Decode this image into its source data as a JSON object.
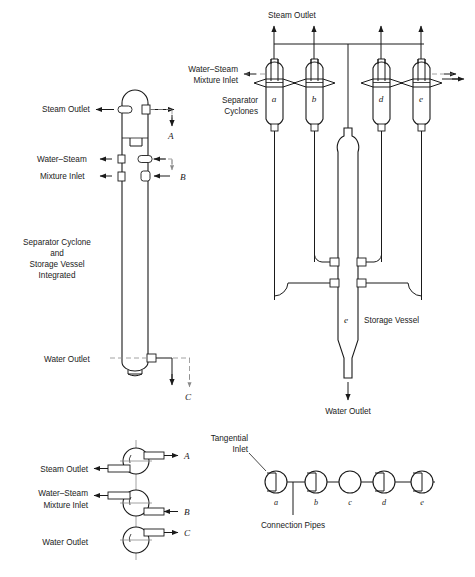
{
  "figure": {
    "line_color": "#1a1a1a",
    "dash_color": "#8a8a8a",
    "background": "#ffffff"
  },
  "left_elevation": {
    "caption_line1": "Separator Cyclone",
    "caption_line2": "and",
    "caption_line3": "Storage Vessel",
    "caption_line4": "Integrated",
    "labels": {
      "steam_outlet": "Steam Outlet",
      "water_steam": "Water–Steam",
      "mixture_inlet": "Mixture Inlet",
      "water_outlet": "Water Outlet"
    },
    "section_marks": {
      "a": "A",
      "b": "B",
      "c": "C"
    }
  },
  "right_elevation": {
    "labels": {
      "steam_outlet": "Steam Outlet",
      "water_steam_mixture_inlet_line1": "Water–Steam",
      "water_steam_mixture_inlet_line2": "Mixture Inlet",
      "separator_cyclones_line1": "Separator",
      "separator_cyclones_line2": "Cyclones",
      "storage_vessel": "Storage Vessel",
      "water_outlet": "Water Outlet"
    },
    "cyclones": [
      {
        "id": "a",
        "label": "a"
      },
      {
        "id": "b",
        "label": "b"
      },
      {
        "id": "d",
        "label": "d"
      },
      {
        "id": "e",
        "label": "e"
      }
    ],
    "storage_vessel_label": "e"
  },
  "left_sections": {
    "labels": {
      "steam_outlet": "Steam Outlet",
      "water_steam": "Water–Steam",
      "mixture_inlet": "Mixture Inlet",
      "water_outlet": "Water Outlet"
    },
    "section_marks": {
      "a": "A",
      "b": "B",
      "c": "C"
    }
  },
  "plan_view": {
    "labels": {
      "tangential_inlet_line1": "Tangential",
      "tangential_inlet_line2": "Inlet",
      "connection_pipes": "Connection Pipes"
    },
    "circles": [
      {
        "id": "a",
        "label": "a",
        "tangential": true
      },
      {
        "id": "b",
        "label": "b",
        "tangential": true
      },
      {
        "id": "c",
        "label": "c",
        "tangential": false
      },
      {
        "id": "d",
        "label": "d",
        "tangential": true
      },
      {
        "id": "e",
        "label": "e",
        "tangential": true
      }
    ]
  }
}
